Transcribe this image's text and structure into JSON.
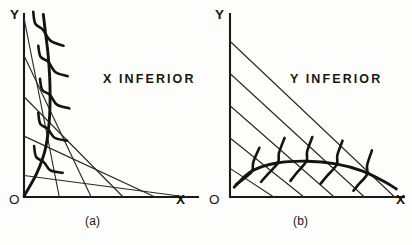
{
  "figure": {
    "background_color": "#fdfdfc",
    "ink_color": "#18170f"
  },
  "chart_data": {
    "type": "line",
    "panels": [
      {
        "id": "a",
        "caption": "(a)",
        "region_label": "X INFERIOR",
        "x_axis_label": "X",
        "y_axis_label": "Y",
        "origin_label": "O",
        "description": "Income expansion path bends back toward the Y axis as income rises, so X is an inferior good.",
        "axis_ranges": {
          "x": [
            0,
            10
          ],
          "y": [
            0,
            10
          ]
        },
        "grid": false,
        "budget_lines": [
          {
            "y_intercept": 10.0,
            "x_intercept": 2.1
          },
          {
            "y_intercept": 7.9,
            "x_intercept": 4.0
          },
          {
            "y_intercept": 5.6,
            "x_intercept": 5.9
          },
          {
            "y_intercept": 3.4,
            "x_intercept": 7.8
          },
          {
            "y_intercept": 1.2,
            "x_intercept": 9.7
          }
        ],
        "expansion_path": {
          "name": "income expansion path",
          "points": [
            [
              0.0,
              0.05
            ],
            [
              0.75,
              1.3
            ],
            [
              1.25,
              2.6
            ],
            [
              1.5,
              4.2
            ],
            [
              1.55,
              6.0
            ],
            [
              1.45,
              7.8
            ],
            [
              1.25,
              9.4
            ],
            [
              1.15,
              10.2
            ]
          ]
        },
        "indifference_curves": [
          {
            "tangency": [
              1.12,
              9.35
            ],
            "span": [
              [
                0.55,
                10.35
              ],
              [
                1.12,
                9.35
              ],
              [
                2.35,
                8.45
              ]
            ]
          },
          {
            "tangency": [
              1.45,
              7.55
            ],
            "span": [
              [
                0.85,
                8.45
              ],
              [
                1.45,
                7.55
              ],
              [
                2.6,
                6.75
              ]
            ]
          },
          {
            "tangency": [
              1.55,
              5.7
            ],
            "span": [
              [
                0.95,
                6.6
              ],
              [
                1.55,
                5.7
              ],
              [
                2.7,
                4.95
              ]
            ]
          },
          {
            "tangency": [
              1.42,
              3.8
            ],
            "span": [
              [
                0.85,
                4.7
              ],
              [
                1.42,
                3.8
              ],
              [
                2.55,
                3.15
              ]
            ]
          },
          {
            "tangency": [
              1.18,
              1.95
            ],
            "span": [
              [
                0.6,
                2.85
              ],
              [
                1.18,
                1.95
              ],
              [
                2.3,
                1.35
              ]
            ]
          }
        ]
      },
      {
        "id": "b",
        "caption": "(b)",
        "region_label": "Y INFERIOR",
        "x_axis_label": "X",
        "y_axis_label": "Y",
        "origin_label": "O",
        "description": "Income expansion path bends down toward the X axis as income rises, so Y is an inferior good.",
        "axis_ranges": {
          "x": [
            0,
            10
          ],
          "y": [
            0,
            10
          ]
        },
        "grid": false,
        "budget_lines": [
          {
            "y_intercept": 8.7,
            "x_intercept": 9.8
          },
          {
            "y_intercept": 6.9,
            "x_intercept": 8.0
          },
          {
            "y_intercept": 5.1,
            "x_intercept": 6.2
          },
          {
            "y_intercept": 3.3,
            "x_intercept": 4.4
          },
          {
            "y_intercept": 1.6,
            "x_intercept": 2.6
          }
        ],
        "expansion_path": {
          "name": "income expansion path",
          "points": [
            [
              0.25,
              0.55
            ],
            [
              1.3,
              1.45
            ],
            [
              2.8,
              1.9
            ],
            [
              4.6,
              2.0
            ],
            [
              6.3,
              1.85
            ],
            [
              7.9,
              1.45
            ],
            [
              9.2,
              0.85
            ],
            [
              9.9,
              0.45
            ]
          ]
        },
        "indifference_curves": [
          {
            "tangency": [
              1.3,
              1.42
            ],
            "span": [
              [
                0.35,
                0.7
              ],
              [
                1.3,
                1.42
              ],
              [
                1.75,
                2.75
              ]
            ]
          },
          {
            "tangency": [
              2.85,
              1.9
            ],
            "span": [
              [
                1.85,
                0.85
              ],
              [
                2.85,
                1.9
              ],
              [
                3.25,
                3.3
              ]
            ]
          },
          {
            "tangency": [
              4.55,
              2.0
            ],
            "span": [
              [
                3.6,
                0.9
              ],
              [
                4.55,
                2.0
              ],
              [
                4.9,
                3.35
              ]
            ]
          },
          {
            "tangency": [
              6.35,
              1.8
            ],
            "span": [
              [
                5.4,
                0.75
              ],
              [
                6.35,
                1.8
              ],
              [
                6.7,
                3.15
              ]
            ]
          },
          {
            "tangency": [
              8.15,
              1.25
            ],
            "span": [
              [
                7.35,
                0.35
              ],
              [
                8.15,
                1.25
              ],
              [
                8.45,
                2.6
              ]
            ]
          }
        ]
      }
    ]
  }
}
